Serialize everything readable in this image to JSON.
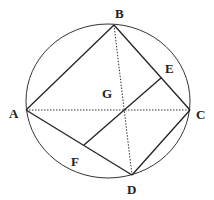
{
  "diagram": {
    "type": "geometry",
    "circle": {
      "cx": 108,
      "cy": 101,
      "rx": 82,
      "ry": 77
    },
    "points": {
      "A": {
        "x": 26,
        "y": 110,
        "label": "A",
        "lx": 9,
        "ly": 118
      },
      "B": {
        "x": 114,
        "y": 25,
        "label": "B",
        "lx": 115,
        "ly": 18
      },
      "C": {
        "x": 190,
        "y": 110,
        "label": "C",
        "lx": 196,
        "ly": 119
      },
      "D": {
        "x": 132,
        "y": 175,
        "label": "D",
        "lx": 127,
        "ly": 194
      },
      "E": {
        "x": 161,
        "y": 78,
        "label": "E",
        "lx": 165,
        "ly": 73
      },
      "F": {
        "x": 84,
        "y": 145,
        "label": "F",
        "lx": 71,
        "ly": 166
      },
      "G": {
        "x": 124,
        "y": 110,
        "label": "G",
        "lx": 102,
        "ly": 98
      }
    },
    "solid_segments": [
      "AB",
      "BC",
      "CD",
      "DA",
      "EF"
    ],
    "dotted_segments": [
      "AC",
      "BD"
    ]
  }
}
